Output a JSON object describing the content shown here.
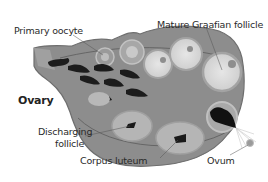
{
  "diagram": {
    "colors": {
      "background": "#ffffff",
      "tissue": "#8a8a8a",
      "tissue_dark": "#6f6f6f",
      "follicle_fill": "#d9d9d9",
      "follicle_ring": "#a8a8a8",
      "dark_structures": "#1a1a1a",
      "label_text": "#2a2a2a",
      "leader_line": "#555555"
    },
    "labels": {
      "primary_oocyte": "Primary oocyte",
      "mature_graafian_follicle": "Mature Graafian follicle",
      "ovary": "Ovary",
      "discharging_follicle_line1": "Discharging",
      "discharging_follicle_line2": "follicle",
      "corpus_luteum": "Corpus luteum",
      "ovum": "Ovum"
    }
  }
}
